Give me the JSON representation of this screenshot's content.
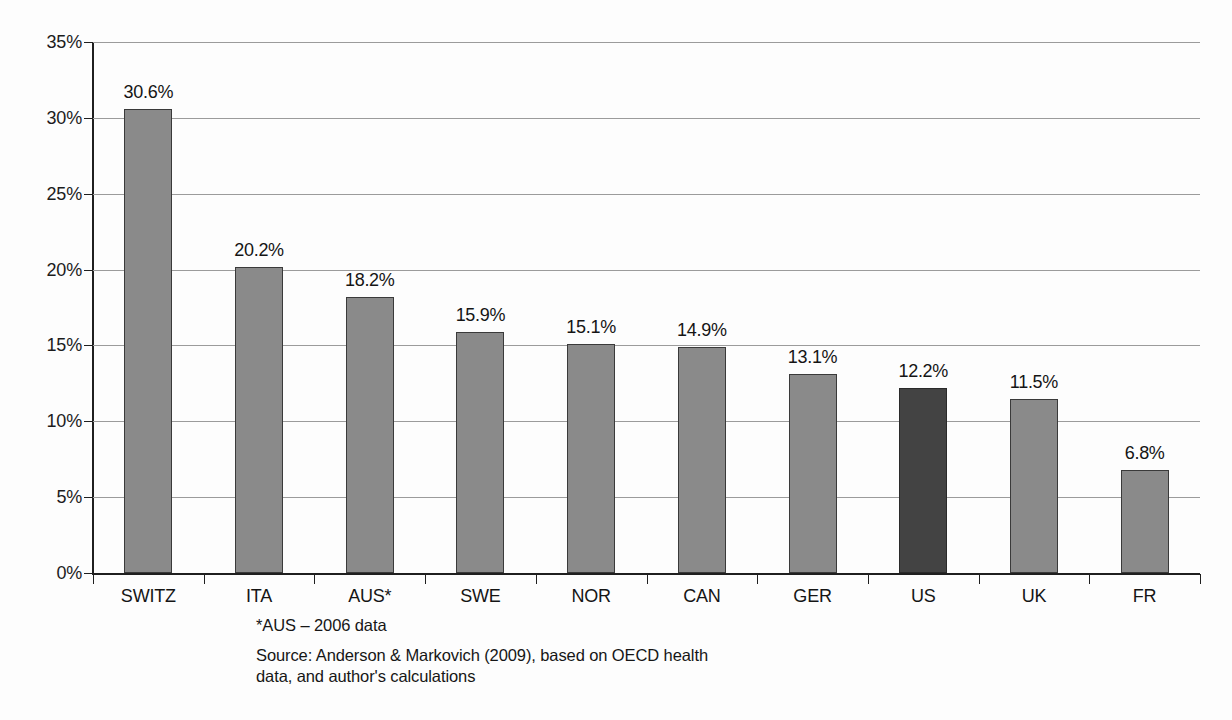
{
  "chart_data": {
    "type": "bar",
    "title": "",
    "subtitle": "",
    "xlabel": "",
    "ylabel": "",
    "categories": [
      "SWITZ",
      "ITA",
      "AUS*",
      "SWE",
      "NOR",
      "CAN",
      "GER",
      "US",
      "UK",
      "FR"
    ],
    "values": [
      30.6,
      20.2,
      18.2,
      15.9,
      15.1,
      14.9,
      13.1,
      12.2,
      11.5,
      6.8
    ],
    "value_labels": [
      "30.6%",
      "20.2%",
      "18.2%",
      "15.9%",
      "15.1%",
      "14.9%",
      "13.1%",
      "12.2%",
      "11.5%",
      "6.8%"
    ],
    "highlight_index": 7,
    "ylim": [
      0,
      35
    ],
    "ytick_values": [
      0,
      5,
      10,
      15,
      20,
      25,
      30,
      35
    ],
    "ytick_labels": [
      "0%",
      "5%",
      "10%",
      "15%",
      "20%",
      "25%",
      "30%",
      "35%"
    ],
    "grid": true,
    "grid_axis": "y",
    "legend": "none",
    "bar_color": "#8a8a8a",
    "highlight_color": "#434343",
    "bar_border_color": "#3a3a3a",
    "gridline_color": "#9b9b9b",
    "axis_color": "#1f1f1f",
    "background_color": "#fdfdfd"
  },
  "notes": {
    "footnote": "*AUS – 2006 data",
    "source_line_1": "Source: Anderson & Markovich (2009), based on OECD health",
    "source_line_2": "data, and author's calculations"
  }
}
